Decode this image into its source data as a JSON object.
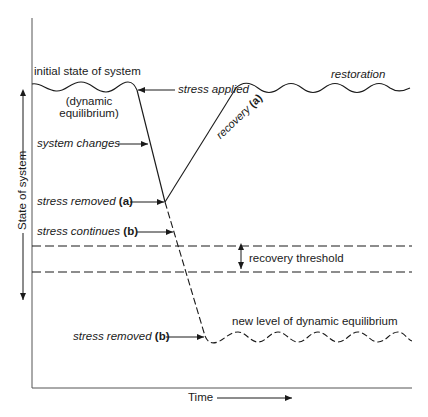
{
  "diagram": {
    "type": "system response to stress over time",
    "axes": {
      "x_label": "Time",
      "y_label": "State of system"
    },
    "labels": {
      "initial_state": "initial state of system",
      "dynamic_eq_1": "(dynamic",
      "dynamic_eq_2": "equilibrium)",
      "stress_applied": "stress applied",
      "restoration": "restoration",
      "system_changes": "system changes",
      "recovery_text": "recovery",
      "recovery_tag": "(a)",
      "stress_removed_a_text": "stress removed",
      "stress_removed_a_tag": "(a)",
      "stress_continues_text": "stress continues",
      "stress_continues_tag": "(b)",
      "recovery_threshold": "recovery threshold",
      "stress_removed_b_text": "stress removed",
      "stress_removed_b_tag": "(b)",
      "new_equilibrium": "new level of dynamic equilibrium"
    },
    "colors": {
      "line": "#1a1a1a",
      "axis": "#555555",
      "background": "#ffffff"
    }
  }
}
